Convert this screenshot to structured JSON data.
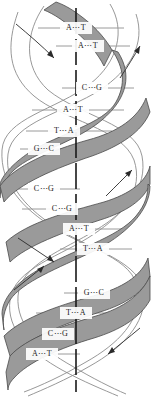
{
  "figure": {
    "name": "dna-double-helix-diagram",
    "type": "scientific-illustration",
    "width": 152,
    "height": 401,
    "background_color": "#ffffff"
  },
  "colors": {
    "ribbon_fill": "#9a9a9a",
    "ribbon_stroke": "#4a4a4a",
    "strand_line": "#8c8c8c",
    "rung_line": "#9a9a9a",
    "axis": "#1a1a1a",
    "text": "#1a1a1a",
    "arrow": "#2a2a2a"
  },
  "axis": {
    "label": "helical-axis",
    "style": "dashed-vertical",
    "x": 76,
    "y_top": 8,
    "y_bottom": 392
  },
  "base_pairs": [
    {
      "id": "bp-1",
      "left": "A",
      "right": "T",
      "text": "A⋯T",
      "y": 28,
      "cx": 76,
      "x1": 38,
      "x2": 124
    },
    {
      "id": "bp-2",
      "left": "A",
      "right": "T",
      "text": "A⋯T",
      "y": 46,
      "cx": 88,
      "x1": 56,
      "x2": 130
    },
    {
      "id": "bp-3",
      "left": "C",
      "right": "G",
      "text": "C⋯G",
      "y": 88,
      "cx": 92,
      "x1": 62,
      "x2": 134
    },
    {
      "id": "bp-4",
      "left": "A",
      "right": "T",
      "text": "A⋯T",
      "y": 110,
      "cx": 73,
      "x1": 32,
      "x2": 124
    },
    {
      "id": "bp-5",
      "left": "T",
      "right": "A",
      "text": "T⋯A",
      "y": 131,
      "cx": 64,
      "x1": 26,
      "x2": 112
    },
    {
      "id": "bp-6",
      "left": "G",
      "right": "C",
      "text": "G⋯C",
      "y": 149,
      "cx": 44,
      "x1": 20,
      "x2": 82
    },
    {
      "id": "bp-7",
      "left": "C",
      "right": "G",
      "text": "C⋯G",
      "y": 189,
      "cx": 44,
      "x1": 18,
      "x2": 80
    },
    {
      "id": "bp-8",
      "left": "C",
      "right": "G",
      "text": "C⋯G",
      "y": 209,
      "cx": 62,
      "x1": 22,
      "x2": 106
    },
    {
      "id": "bp-9",
      "left": "A",
      "right": "T",
      "text": "A⋯T",
      "y": 229,
      "cx": 79,
      "x1": 42,
      "x2": 124
    },
    {
      "id": "bp-10",
      "left": "T",
      "right": "A",
      "text": "T⋯A",
      "y": 249,
      "cx": 93,
      "x1": 60,
      "x2": 132
    },
    {
      "id": "bp-11",
      "left": "G",
      "right": "C",
      "text": "G⋯C",
      "y": 293,
      "cx": 94,
      "x1": 64,
      "x2": 134
    },
    {
      "id": "bp-12",
      "left": "T",
      "right": "A",
      "text": "T⋯A",
      "y": 313,
      "cx": 76,
      "x1": 36,
      "x2": 122
    },
    {
      "id": "bp-13",
      "left": "C",
      "right": "G",
      "text": "C⋯G",
      "y": 334,
      "cx": 58,
      "x1": 22,
      "x2": 102
    },
    {
      "id": "bp-14",
      "left": "A",
      "right": "T",
      "text": "A⋯T",
      "y": 354,
      "cx": 42,
      "x1": 18,
      "x2": 80
    }
  ],
  "sequence": {
    "left_strand": "A A C A T G C C A T G T C A",
    "right_strand": "T T G T A C G G T A C A G T"
  },
  "arrows": [
    {
      "id": "arrow-1",
      "direction": "down-right",
      "region": "upper-left"
    },
    {
      "id": "arrow-2",
      "direction": "up-right",
      "region": "upper-right"
    },
    {
      "id": "arrow-3",
      "direction": "up-right",
      "region": "middle-right"
    },
    {
      "id": "arrow-4",
      "direction": "down-right",
      "region": "lower-left-upper"
    },
    {
      "id": "arrow-5",
      "direction": "up-right",
      "region": "lower-left"
    },
    {
      "id": "arrow-6",
      "direction": "down-left",
      "region": "bottom-right"
    }
  ]
}
